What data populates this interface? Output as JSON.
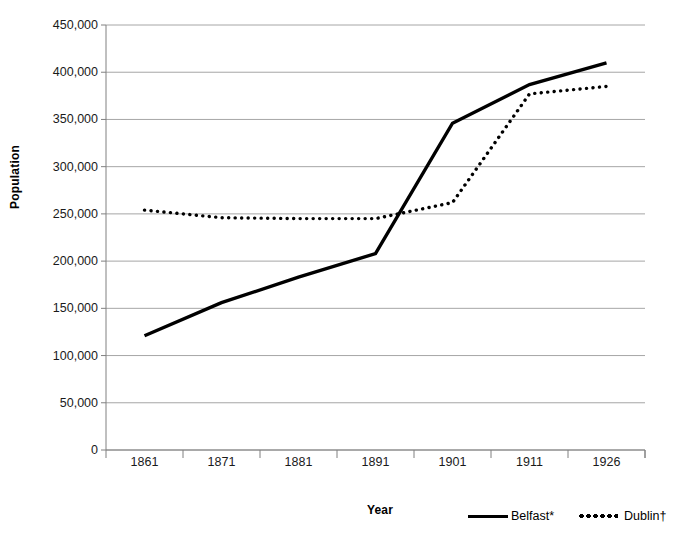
{
  "chart_data": {
    "type": "line",
    "title": "",
    "subtitle": "",
    "xlabel": "Year",
    "ylabel": "Population",
    "categories": [
      "1861",
      "1871",
      "1881",
      "1891",
      "1901",
      "1911",
      "1926"
    ],
    "ylim": [
      0,
      450000
    ],
    "ytick_step": 50000,
    "yticks": [
      "0",
      "50,000",
      "100,000",
      "150,000",
      "200,000",
      "250,000",
      "300,000",
      "350,000",
      "400,000",
      "450,000"
    ],
    "ytick_values": [
      0,
      50000,
      100000,
      150000,
      200000,
      250000,
      300000,
      350000,
      400000,
      450000
    ],
    "grid": "horizontal",
    "legend_position": "bottom-right",
    "series": [
      {
        "name": "Belfast*",
        "style": "solid",
        "color": "#000000",
        "values": [
          121000,
          156000,
          183000,
          208000,
          346000,
          387000,
          410000
        ]
      },
      {
        "name": "Dublin†",
        "style": "dotted",
        "color": "#000000",
        "values": [
          254000,
          246000,
          245000,
          245000,
          262000,
          377000,
          385000
        ]
      }
    ]
  },
  "axes": {
    "y_title": "Population",
    "x_title": "Year"
  },
  "legend": {
    "items": [
      {
        "label": "Belfast*",
        "marker": "solid-line-swatch"
      },
      {
        "label": "Dublin†",
        "marker": "dotted-line-swatch"
      }
    ]
  },
  "colors": {
    "line": "#000000",
    "grid": "#a6a6a6",
    "axis": "#808080",
    "background": "#ffffff"
  }
}
